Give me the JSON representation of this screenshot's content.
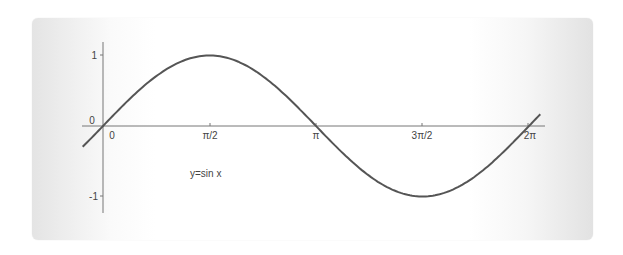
{
  "chart_data": {
    "type": "line",
    "title": "",
    "annotation": "y=sin x",
    "xlabel": "",
    "ylabel": "",
    "x_tick_labels": [
      "0",
      "π/2",
      "π",
      "3π/2",
      "2π"
    ],
    "x_tick_values": [
      0,
      1.5708,
      3.1416,
      4.7124,
      6.2832
    ],
    "y_tick_labels": [
      "1",
      "0",
      "-1"
    ],
    "y_tick_values": [
      1,
      0,
      -1
    ],
    "xlim": [
      -0.3,
      6.45
    ],
    "ylim": [
      -1.2,
      1.2
    ],
    "grid": false,
    "legend": null,
    "series": [
      {
        "name": "y=sin x",
        "x": [
          -0.3,
          0,
          0.7854,
          1.5708,
          2.3562,
          3.1416,
          3.927,
          4.7124,
          5.4978,
          6.2832,
          6.45
        ],
        "values": [
          -0.296,
          0,
          0.707,
          1,
          0.707,
          0,
          -0.707,
          -1,
          -0.707,
          0,
          0.166
        ]
      }
    ],
    "color": "#555555"
  },
  "labels": {
    "origin_y": "0",
    "x0": "0",
    "xpi2": "π/2",
    "xpi": "π",
    "x3pi2": "3π/2",
    "x2pi": "2π",
    "y1": "1",
    "yneg1": "-1",
    "func": "y=sin x"
  }
}
